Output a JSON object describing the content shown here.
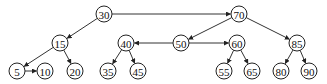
{
  "diagram": {
    "type": "tree-with-links",
    "nodes": [
      {
        "id": "n30",
        "label": "30",
        "x": 104,
        "y": 14
      },
      {
        "id": "n70",
        "label": "70",
        "x": 239,
        "y": 14
      },
      {
        "id": "n15",
        "label": "15",
        "x": 60,
        "y": 43
      },
      {
        "id": "n40",
        "label": "40",
        "x": 126,
        "y": 43
      },
      {
        "id": "n50",
        "label": "50",
        "x": 181,
        "y": 43
      },
      {
        "id": "n60",
        "label": "60",
        "x": 237,
        "y": 43
      },
      {
        "id": "n85",
        "label": "85",
        "x": 297,
        "y": 43
      },
      {
        "id": "n5",
        "label": "5",
        "x": 17,
        "y": 71
      },
      {
        "id": "n10",
        "label": "10",
        "x": 45,
        "y": 71
      },
      {
        "id": "n20",
        "label": "20",
        "x": 75,
        "y": 71
      },
      {
        "id": "n35",
        "label": "35",
        "x": 108,
        "y": 71
      },
      {
        "id": "n45",
        "label": "45",
        "x": 138,
        "y": 71
      },
      {
        "id": "n55",
        "label": "55",
        "x": 224,
        "y": 71
      },
      {
        "id": "n65",
        "label": "65",
        "x": 252,
        "y": 71
      },
      {
        "id": "n80",
        "label": "80",
        "x": 281,
        "y": 71
      },
      {
        "id": "n90",
        "label": "90",
        "x": 309,
        "y": 71
      }
    ],
    "edges": [
      {
        "from": "n30",
        "to": "n70"
      },
      {
        "from": "n30",
        "to": "n15"
      },
      {
        "from": "n70",
        "to": "n50"
      },
      {
        "from": "n70",
        "to": "n85"
      },
      {
        "from": "n50",
        "to": "n40"
      },
      {
        "from": "n50",
        "to": "n60"
      },
      {
        "from": "n15",
        "to": "n5"
      },
      {
        "from": "n15",
        "to": "n20"
      },
      {
        "from": "n5",
        "to": "n10"
      },
      {
        "from": "n40",
        "to": "n35"
      },
      {
        "from": "n40",
        "to": "n45"
      },
      {
        "from": "n60",
        "to": "n55"
      },
      {
        "from": "n60",
        "to": "n65"
      },
      {
        "from": "n85",
        "to": "n80"
      },
      {
        "from": "n85",
        "to": "n90"
      }
    ],
    "node_radius": 8
  }
}
